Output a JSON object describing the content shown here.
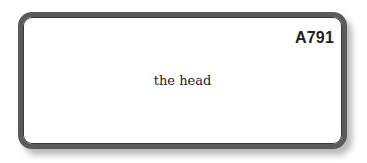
{
  "card": {
    "id_label": "A791",
    "text": "the head",
    "border_color": "#5a5a5a"
  }
}
